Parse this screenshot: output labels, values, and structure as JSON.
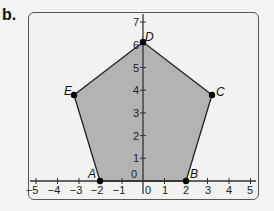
{
  "part_label": "b.",
  "colors": {
    "fill": "#b3b3b3",
    "edge": "#222222",
    "axis": "#333333",
    "point": "#000000"
  },
  "axes": {
    "x_ticks": [
      "−5",
      "−4",
      "−3",
      "−2",
      "−1",
      "0",
      "1",
      "2",
      "3",
      "4",
      "5"
    ],
    "y_ticks": [
      "0",
      "1",
      "2",
      "3",
      "4",
      "5",
      "6",
      "7"
    ]
  },
  "polygon": {
    "name": "pentagon",
    "vertices": [
      {
        "label": "A",
        "x": -2,
        "y": 0
      },
      {
        "label": "B",
        "x": 2,
        "y": 0
      },
      {
        "label": "C",
        "x": 3.2,
        "y": 3.8
      },
      {
        "label": "D",
        "x": 0,
        "y": 6.1
      },
      {
        "label": "E",
        "x": -3.4,
        "y": 3.8
      }
    ]
  }
}
